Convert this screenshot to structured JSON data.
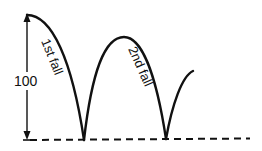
{
  "diagram": {
    "height_label": "100",
    "first_fall_label": "1st fall",
    "second_fall_label": "2nd fall",
    "colors": {
      "stroke": "#111111",
      "background": "#ffffff"
    }
  }
}
